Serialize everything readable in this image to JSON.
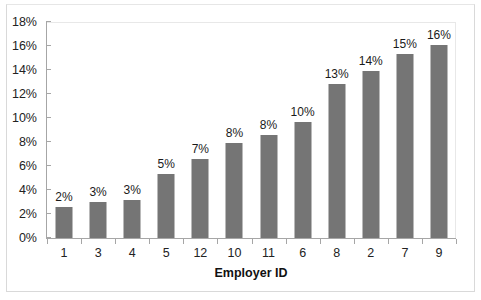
{
  "chart_data": {
    "type": "bar",
    "title": "",
    "xlabel": "Employer ID",
    "ylabel": "",
    "categories": [
      "1",
      "3",
      "4",
      "5",
      "12",
      "10",
      "11",
      "6",
      "8",
      "2",
      "7",
      "9"
    ],
    "values": [
      2.6,
      3.0,
      3.2,
      5.3,
      6.6,
      7.9,
      8.6,
      9.7,
      12.8,
      13.9,
      15.3,
      16.1
    ],
    "data_labels": [
      "2%",
      "3%",
      "3%",
      "5%",
      "7%",
      "8%",
      "8%",
      "10%",
      "13%",
      "14%",
      "15%",
      "16%"
    ],
    "ylim": [
      0,
      18
    ],
    "ytick_values": [
      0,
      2,
      4,
      6,
      8,
      10,
      12,
      14,
      16,
      18
    ],
    "ytick_labels": [
      "0%",
      "2%",
      "4%",
      "6%",
      "8%",
      "10%",
      "12%",
      "14%",
      "16%",
      "18%"
    ],
    "grid": false,
    "legend": false,
    "bar_color": "#757575",
    "axis_color": "#a6a6a6",
    "plot_background": "#ffffff"
  },
  "axis": {
    "x_title": "Employer ID"
  }
}
